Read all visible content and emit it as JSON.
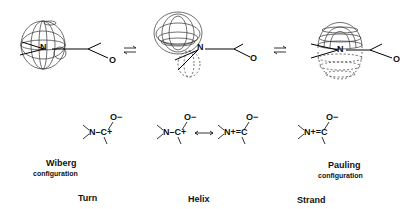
{
  "atoms": {
    "n": "N",
    "o": "O",
    "o_minus": "O−",
    "c_plus": "C+",
    "n_plus": "N+",
    "c": "C"
  },
  "equilibrium_symbol": "⇌",
  "resonance_symbol": "↔",
  "structures": [
    {
      "formula_left": "N–C+",
      "formula_top": "O−"
    },
    {
      "formula_left": "N–C+",
      "formula_right": "N+=C",
      "formula_top": "O−"
    },
    {
      "formula_left": "N+=C",
      "formula_top": "O−"
    }
  ],
  "labels": {
    "wiberg": "Wiberg",
    "wiberg_sub": "configuration",
    "pauling": "Pauling",
    "pauling_sub": "configuration",
    "turn": "Turn",
    "helix": "Helix",
    "strand": "Strand"
  }
}
